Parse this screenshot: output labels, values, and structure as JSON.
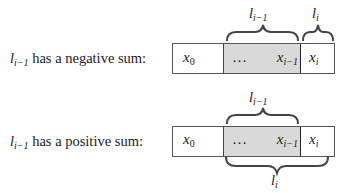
{
  "rows": [
    {
      "label": {
        "var": "l",
        "sub": "i−1",
        "text": " has a negative sum:"
      },
      "cells": [
        {
          "var": "x",
          "sub": "0"
        },
        {
          "ellipsis": "…",
          "var": "x",
          "sub": "i−1"
        },
        {
          "var": "x",
          "sub": "i"
        }
      ],
      "top_braces": [
        {
          "var": "l",
          "sub": "i−1",
          "spans": "shaded segment"
        },
        {
          "var": "l",
          "sub": "i",
          "spans": "last cell"
        }
      ]
    },
    {
      "label": {
        "var": "l",
        "sub": "i−1",
        "text": " has a positive sum:"
      },
      "cells": [
        {
          "var": "x",
          "sub": "0"
        },
        {
          "ellipsis": "…",
          "var": "x",
          "sub": "i−1"
        },
        {
          "var": "x",
          "sub": "i"
        }
      ],
      "top_braces": [
        {
          "var": "l",
          "sub": "i−1",
          "spans": "shaded segment"
        }
      ],
      "bottom_braces": [
        {
          "var": "l",
          "sub": "i",
          "spans": "shaded segment plus last cell"
        }
      ]
    }
  ],
  "colors": {
    "shade": "#d9d9d9",
    "border": "#555555",
    "text": "#222222"
  }
}
